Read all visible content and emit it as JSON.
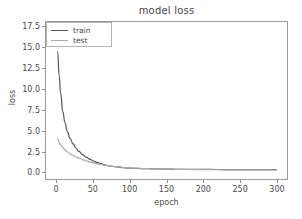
{
  "chart_data": {
    "type": "line",
    "title": "model loss",
    "xlabel": "epoch",
    "ylabel": "loss",
    "xlim": [
      -15,
      315
    ],
    "ylim": [
      -0.9,
      18.1
    ],
    "xticks": [
      0,
      50,
      100,
      150,
      200,
      250,
      300
    ],
    "xticklabels": [
      "0",
      "50",
      "100",
      "150",
      "200",
      "250",
      "300"
    ],
    "yticks": [
      0.0,
      2.5,
      5.0,
      7.5,
      10.0,
      12.5,
      15.0,
      17.5
    ],
    "yticklabels": [
      "0.0",
      "2.5",
      "5.0",
      "7.5",
      "10.0",
      "12.5",
      "15.0",
      "17.5"
    ],
    "grid": false,
    "legend_position": "upper left",
    "series": [
      {
        "name": "train",
        "color": "#555555",
        "x": [
          1,
          3,
          5,
          8,
          11,
          14,
          18,
          22,
          26,
          30,
          35,
          40,
          45,
          50,
          55,
          60,
          65,
          70,
          75,
          80,
          90,
          100,
          110,
          120,
          130,
          140,
          150,
          165,
          180,
          200,
          220,
          240,
          260,
          280,
          300
        ],
        "values": [
          14.5,
          11.6,
          9.5,
          7.3,
          5.9,
          4.9,
          4.0,
          3.35,
          2.85,
          2.45,
          2.05,
          1.75,
          1.5,
          1.28,
          1.1,
          0.95,
          0.82,
          0.72,
          0.64,
          0.58,
          0.48,
          0.42,
          0.38,
          0.35,
          0.33,
          0.31,
          0.3,
          0.28,
          0.27,
          0.26,
          0.25,
          0.24,
          0.24,
          0.23,
          0.23
        ]
      },
      {
        "name": "test",
        "color": "#aaaaaa",
        "x": [
          1,
          3,
          5,
          8,
          11,
          14,
          18,
          22,
          26,
          30,
          35,
          40,
          45,
          50,
          55,
          60,
          65,
          70,
          75,
          80,
          90,
          100,
          110,
          120,
          130,
          140,
          150,
          165,
          180,
          200,
          220,
          240,
          260,
          280,
          300
        ],
        "values": [
          4.0,
          3.55,
          3.25,
          2.9,
          2.62,
          2.4,
          2.15,
          1.95,
          1.78,
          1.62,
          1.45,
          1.3,
          1.17,
          1.05,
          0.95,
          0.86,
          0.78,
          0.71,
          0.65,
          0.6,
          0.51,
          0.45,
          0.4,
          0.36,
          0.33,
          0.31,
          0.29,
          0.27,
          0.25,
          0.23,
          0.22,
          0.21,
          0.2,
          0.2,
          0.19
        ]
      }
    ]
  },
  "legend": {
    "items": [
      {
        "label": "train",
        "color": "#555555"
      },
      {
        "label": "test",
        "color": "#aaaaaa"
      }
    ]
  }
}
